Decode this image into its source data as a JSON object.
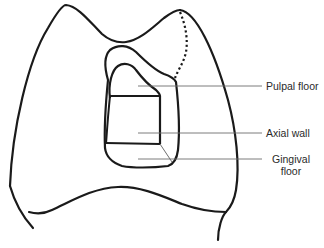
{
  "diagram": {
    "labels": [
      {
        "id": "pulpal-floor",
        "text": "Pulpal floor"
      },
      {
        "id": "axial-wall",
        "text": "Axial wall"
      },
      {
        "id": "gingival-floor",
        "line1": "Gingival",
        "line2": "floor"
      }
    ],
    "colors": {
      "outline": "#1a1a1a",
      "leader": "#6e6e6e",
      "text": "#2a2a2a",
      "background": "#ffffff"
    }
  }
}
